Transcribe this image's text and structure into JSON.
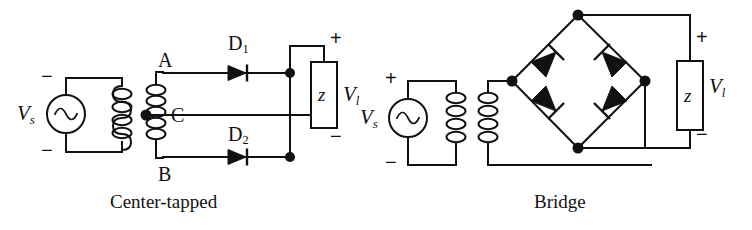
{
  "figure": {
    "type": "circuit-diagram",
    "background_color": "#ffffff",
    "line_color": "#111111"
  },
  "circuits": [
    {
      "id": "center-tapped",
      "caption": "Center-tapped",
      "source": {
        "label": "V",
        "label_sub": "s",
        "symbol": "ac-source-sine",
        "terminal_top": "−",
        "terminal_bottom": "−"
      },
      "transformer": {
        "primary_turns": 4,
        "secondary_turns": 6,
        "center_tap": true,
        "tap_label": "C",
        "top_terminal_label": "A",
        "bottom_terminal_label": "B"
      },
      "diodes": [
        {
          "label": "D",
          "label_sub": "1",
          "orientation": "left-to-right"
        },
        {
          "label": "D",
          "label_sub": "2",
          "orientation": "left-to-right"
        }
      ],
      "load": {
        "label": "z",
        "voltage_label": "V",
        "voltage_sub": "l",
        "terminal_top": "+",
        "terminal_bottom": "−"
      }
    },
    {
      "id": "bridge",
      "caption": "Bridge",
      "source": {
        "label": "V",
        "label_sub": "s",
        "symbol": "ac-source-sine",
        "terminal_top": "+",
        "terminal_bottom": "−"
      },
      "transformer": {
        "primary_turns": 4,
        "secondary_turns": 4,
        "center_tap": false
      },
      "diodes": [
        {
          "position": "upper-left",
          "orientation": "points-up-right"
        },
        {
          "position": "upper-right",
          "orientation": "points-up-left"
        },
        {
          "position": "lower-left",
          "orientation": "points-up-left"
        },
        {
          "position": "lower-right",
          "orientation": "points-up-right"
        }
      ],
      "load": {
        "label": "z",
        "voltage_label": "V",
        "voltage_sub": "l",
        "terminal_top": "+",
        "terminal_bottom": "−"
      }
    }
  ]
}
